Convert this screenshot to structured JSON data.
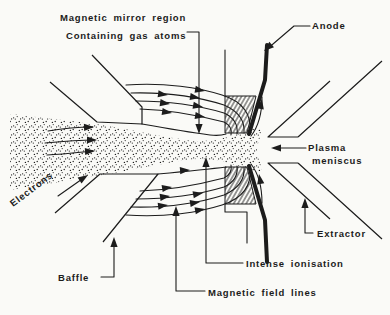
{
  "diagram": {
    "title_implicit": "Plasma ion source schematic",
    "labels": {
      "magnetic_mirror_region": "Magnetic mirror region",
      "containing_gas_atoms": "Containing gas atoms",
      "anode": "Anode",
      "plasma_meniscus_line1": "Plasma",
      "plasma_meniscus_line2": "meniscus",
      "electrons": "Electrons",
      "extractor": "Extractor",
      "baffle": "Baffle",
      "intense_ionisation": "Intense ionisation",
      "magnetic_field_lines": "Magnetic field lines"
    },
    "colors": {
      "ink": "#1c1c1c",
      "paper": "#fafaf7"
    }
  }
}
